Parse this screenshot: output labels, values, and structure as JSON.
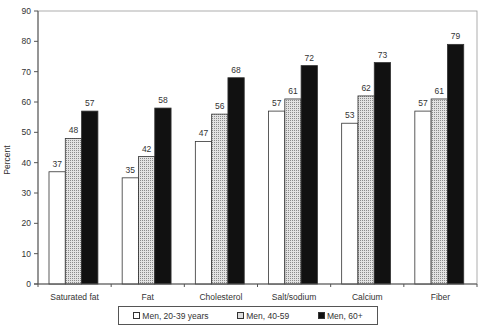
{
  "chart_data": {
    "type": "bar",
    "title": "",
    "xlabel": "",
    "ylabel": "Percent",
    "ylim": [
      0,
      90
    ],
    "yticks": [
      0,
      10,
      20,
      30,
      40,
      50,
      60,
      70,
      80,
      90
    ],
    "grid": false,
    "legend_position": "bottom",
    "categories": [
      "Saturated fat",
      "Fat",
      "Cholesterol",
      "Salt/sodium",
      "Calcium",
      "Fiber"
    ],
    "series": [
      {
        "name": "Men, 20-39 years",
        "fill": "white",
        "values": [
          37,
          35,
          47,
          57,
          53,
          57
        ]
      },
      {
        "name": "Men, 40-59",
        "fill": "dotted",
        "values": [
          48,
          42,
          56,
          61,
          62,
          61
        ]
      },
      {
        "name": "Men, 60+",
        "fill": "black",
        "values": [
          57,
          58,
          68,
          72,
          73,
          79
        ]
      }
    ]
  },
  "legend": {
    "items": [
      {
        "label": "Men, 20-39 years"
      },
      {
        "label": "Men, 40-59"
      },
      {
        "label": "Men, 60+"
      }
    ]
  },
  "colors": {
    "bar_black": "#111111",
    "bar_dotted_bg": "#dddddd",
    "bar_white": "#ffffff",
    "axis": "#555555"
  }
}
